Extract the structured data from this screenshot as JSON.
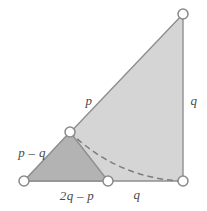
{
  "figure": {
    "type": "geometric-diagram",
    "width": 207,
    "height": 211,
    "background_color": "#ffffff"
  },
  "colors": {
    "large_triangle_fill": "#d5d5d5",
    "small_triangle_fill": "#b3b3b3",
    "stroke": "#8f8f8f",
    "dashed_arc": "#7d7d7d",
    "marker_fill": "#ffffff",
    "marker_stroke": "#8a8a8a",
    "label_text": "#4a4a4a"
  },
  "vertices": [
    {
      "name": "bottom-left",
      "x": 24,
      "y": 181
    },
    {
      "name": "bottom-middle",
      "x": 108,
      "y": 181
    },
    {
      "name": "bottom-right",
      "x": 183,
      "y": 181
    },
    {
      "name": "middle-apex",
      "x": 70,
      "y": 132
    },
    {
      "name": "top-right",
      "x": 183,
      "y": 14
    }
  ],
  "shapes": {
    "large_triangle": {
      "name": "large-right-triangle",
      "points": "24,181 183,181 183,14",
      "fill": "#d5d5d5"
    },
    "small_triangle": {
      "name": "small-shaded-triangle",
      "points": "24,181 70,132 108,181",
      "fill": "#b3b3b3"
    },
    "arc": {
      "name": "dashed-arc",
      "path": "M 70 132 A 167 167 0 0 0 183 181",
      "dash_pattern": "6 4"
    }
  },
  "labels": {
    "hypotenuse": {
      "text": "p",
      "x": 89,
      "y": 100
    },
    "right_side": {
      "text": "q",
      "x": 194,
      "y": 100
    },
    "bottom_right_segment": {
      "text": "q",
      "x": 137,
      "y": 194
    },
    "small_triangle_left": {
      "text": "p – q",
      "x": 32,
      "y": 152
    },
    "small_triangle_base": {
      "text": "2q – p",
      "x": 77,
      "y": 195
    }
  }
}
